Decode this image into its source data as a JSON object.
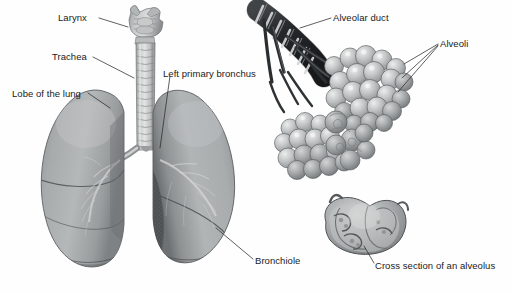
{
  "figure": {
    "background_color": "#fefefe",
    "line_color": "#2b2b2b",
    "text_color": "#1a1a1a",
    "width": 512,
    "height": 293
  },
  "labels": {
    "larynx": "Larynx",
    "trachea": "Trachea",
    "lobe_of_the_lung": "Lobe of the lung",
    "left_primary_bronchus": "Left primary bronchus",
    "alveolar_duct": "Alveolar duct",
    "alveoli": "Alveoli",
    "bronchiole": "Bronchiole",
    "cross_section_of_an_alveolus": "Cross section of an alveolus"
  },
  "structures": {
    "larynx": "larynx-illustration",
    "trachea": "trachea-illustration",
    "left_lung": "left-lung-illustration",
    "right_lung": "right-lung-illustration",
    "bronchial_tree": "bronchial-tree-illustration",
    "alveolar_duct": "alveolar-duct-illustration",
    "alveolar_sacs": "alveolar-sac-cluster-illustration",
    "alveolus_cross_section": "alveolus-cross-section-illustration"
  },
  "palette": {
    "lung_light": "#b9bbbb",
    "lung_mid": "#8e9192",
    "lung_dark": "#5d6162",
    "lung_shadow": "#43474a",
    "cartilage_light": "#d8d9d9",
    "cartilage_mid": "#a9abab",
    "duct_dark": "#2e3133",
    "alveoli_light": "#d2d4d4",
    "alveoli_mid": "#9fa2a3",
    "outline": "#35383a"
  }
}
